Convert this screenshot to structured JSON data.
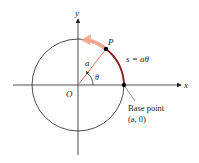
{
  "figure": {
    "axis_labels": {
      "x": "x",
      "y": "y"
    },
    "origin_label": "O",
    "point_label": "P",
    "radius_label": "a",
    "angle_label": "θ",
    "arc_length_label": "s = aθ",
    "base_point": {
      "line1": "Base point",
      "line2": "(a, 0)"
    },
    "colors": {
      "axis": "#231f20",
      "circle": "#231f20",
      "radius": "#e8745a",
      "arc": "#8b1a1a",
      "arrow": "#f4a58c"
    }
  }
}
